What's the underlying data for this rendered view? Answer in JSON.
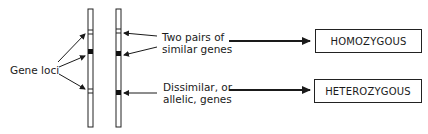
{
  "labels": {
    "gene_loci": "Gene loci",
    "similar_line1": "Two pairs of",
    "similar_line2": "similar genes",
    "allelic_line1": "Dissimilar, or",
    "allelic_line2": "allelic, genes"
  },
  "boxes": {
    "homozygous": "HOMOZYGOUS",
    "heterozygous": "HETEROZYGOUS"
  },
  "chromosomes": [
    {
      "name": "left",
      "loci": [
        "band-pair",
        "solid",
        "band-pair"
      ]
    },
    {
      "name": "right",
      "loci": [
        "band-pair",
        "solid",
        "solid"
      ]
    }
  ]
}
